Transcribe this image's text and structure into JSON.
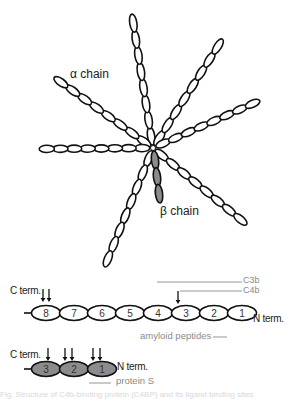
{
  "diagram": {
    "hub": {
      "x": 153,
      "y": 148
    },
    "alpha_label": "α chain",
    "beta_label": "β chain",
    "alpha_chains": [
      {
        "name": "top",
        "end": [
          132,
          15
        ],
        "links": 8
      },
      {
        "name": "upper-right",
        "end": [
          222,
          40
        ],
        "links": 8
      },
      {
        "name": "right",
        "end": [
          259,
          101
        ],
        "links": 8
      },
      {
        "name": "upper-left",
        "end": [
          55,
          78
        ],
        "links": 8
      },
      {
        "name": "left",
        "end": [
          40,
          149
        ],
        "links": 8
      },
      {
        "name": "lower-left",
        "end": [
          105,
          266
        ],
        "links": 8
      },
      {
        "name": "lower-right",
        "end": [
          246,
          224
        ],
        "links": 8
      }
    ],
    "beta_chain": {
      "end": [
        160,
        202
      ],
      "links": 3
    },
    "colors": {
      "stroke": "#111111",
      "beta_fill": "#8c8c8c",
      "grey_text": "#8a8a8a"
    }
  },
  "alpha_domain_map": {
    "c_term_label": "C term.",
    "n_term_label": "N term.",
    "domains": [
      "8",
      "7",
      "6",
      "5",
      "4",
      "3",
      "2",
      "1"
    ],
    "cleavage_arrows_at": [
      "8",
      "8",
      "3"
    ],
    "annotations": [
      {
        "label": "C3b",
        "color": "#8a8a8a"
      },
      {
        "label": "C4b",
        "color": "#8a8a8a"
      },
      {
        "label": "amyloid peptides",
        "color": "#8a8a8a"
      }
    ]
  },
  "beta_domain_map": {
    "c_term_label": "C term.",
    "n_term_label": "N term.",
    "domains": [
      "3",
      "2",
      "1"
    ],
    "cleavage_arrows_at": [
      "3",
      "2",
      "2",
      "1",
      "1"
    ],
    "annotations": [
      {
        "label": "protein S",
        "color": "#8a8a8a"
      }
    ]
  },
  "caption": {
    "text": "Fig. Structure of C4b-binding protein (C4BP) and its ligand binding sites"
  }
}
